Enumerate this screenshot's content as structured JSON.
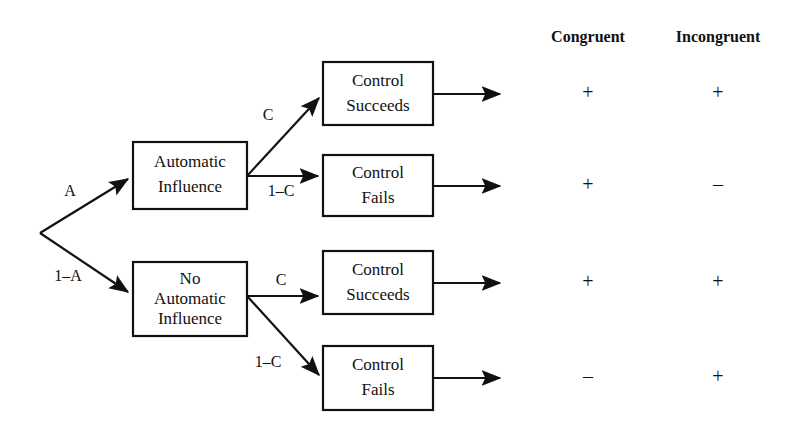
{
  "diagram": {
    "columns": [
      {
        "label": "Congruent",
        "x": 588
      },
      {
        "label": "Incongruent",
        "x": 718
      }
    ],
    "root": {
      "x": 40,
      "y": 233
    },
    "nodes": [
      {
        "id": "automatic-influence",
        "lines": [
          "Automatic",
          "Influence"
        ],
        "x": 133,
        "y": 142,
        "w": 114,
        "h": 67
      },
      {
        "id": "no-automatic-influence",
        "lines": [
          "No",
          "Automatic",
          "Influence"
        ],
        "x": 133,
        "y": 262,
        "w": 114,
        "h": 74
      },
      {
        "id": "control-succeeds-1",
        "lines": [
          "Control",
          "Succeeds"
        ],
        "x": 323,
        "y": 62,
        "w": 110,
        "h": 63
      },
      {
        "id": "control-fails-1",
        "lines": [
          "Control",
          "Fails"
        ],
        "x": 323,
        "y": 155,
        "w": 110,
        "h": 61
      },
      {
        "id": "control-succeeds-2",
        "lines": [
          "Control",
          "Succeeds"
        ],
        "x": 323,
        "y": 251,
        "w": 110,
        "h": 63
      },
      {
        "id": "control-fails-2",
        "lines": [
          "Control",
          "Fails"
        ],
        "x": 323,
        "y": 346,
        "w": 110,
        "h": 64
      }
    ],
    "edges": [
      {
        "id": "edge-a",
        "label": "A",
        "label_x": 70,
        "label_y": 192,
        "x1": 40,
        "y1": 233,
        "x2": 133,
        "y2": 176
      },
      {
        "id": "edge-one-minus-a",
        "label": "1–A",
        "label_x": 68,
        "label_y": 277,
        "x1": 40,
        "y1": 233,
        "x2": 133,
        "y2": 295
      },
      {
        "id": "edge-c-upper",
        "label": "C",
        "label_x": 268,
        "label_y": 116,
        "x1": 247,
        "y1": 176,
        "x2": 323,
        "y2": 94
      },
      {
        "id": "edge-one-minus-c-upper",
        "label": "1–C",
        "label_x": 281,
        "label_y": 192,
        "x1": 247,
        "y1": 176,
        "x2": 323,
        "y2": 176
      },
      {
        "id": "edge-c-lower",
        "label": "C",
        "label_x": 281,
        "label_y": 281,
        "x1": 247,
        "y1": 296,
        "x2": 323,
        "y2": 296
      },
      {
        "id": "edge-one-minus-c-lower",
        "label": "1–C",
        "label_x": 268,
        "label_y": 363,
        "x1": 247,
        "y1": 296,
        "x2": 323,
        "y2": 378
      }
    ],
    "outputs": [
      {
        "id": "output-arrow-1",
        "x1": 433,
        "y1": 94,
        "x2": 505
      },
      {
        "id": "output-arrow-2",
        "x1": 433,
        "y1": 186,
        "x2": 505
      },
      {
        "id": "output-arrow-3",
        "x1": 433,
        "y1": 283,
        "x2": 505
      },
      {
        "id": "output-arrow-4",
        "x1": 433,
        "y1": 378,
        "x2": 505
      }
    ],
    "outcome_rows": [
      {
        "id": "row-1",
        "y": 94,
        "congruent": "+",
        "incongruent": "+"
      },
      {
        "id": "row-2",
        "y": 186,
        "congruent": "+",
        "incongruent": "–"
      },
      {
        "id": "row-3",
        "y": 283,
        "congruent": "+",
        "incongruent": "+"
      },
      {
        "id": "row-4",
        "y": 378,
        "congruent": "–",
        "incongruent": "+"
      }
    ],
    "header_y": 38,
    "color_line": "#111111",
    "color_text": "#111111",
    "color_background": "#ffffff"
  }
}
